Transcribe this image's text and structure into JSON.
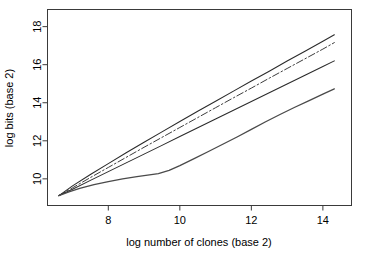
{
  "chart_data": {
    "type": "line",
    "title": "",
    "xlabel": "log number of clones (base 2)",
    "ylabel": "log bits (base 2)",
    "xlim": [
      6.3,
      14.8
    ],
    "ylim": [
      8.6,
      18.9
    ],
    "xticks": [
      8,
      10,
      12,
      14
    ],
    "xtick_labels": [
      "8",
      "10",
      "12",
      "14"
    ],
    "yticks": [
      10,
      12,
      14,
      16,
      18
    ],
    "ytick_labels": [
      "10",
      "12",
      "14",
      "16",
      "18"
    ],
    "grid": false,
    "legend": false,
    "legend_position": "none",
    "box": true,
    "series": [
      {
        "name": "upper-bound-line",
        "style": "solid",
        "color": "#2b2b2b",
        "width": 1.1,
        "x": [
          6.62,
          7.0,
          7.5,
          8.0,
          8.5,
          9.0,
          9.5,
          10.0,
          10.5,
          11.0,
          11.5,
          12.0,
          12.5,
          13.0,
          13.5,
          14.0,
          14.32
        ],
        "y": [
          9.12,
          9.63,
          10.23,
          10.8,
          11.37,
          11.92,
          12.47,
          13.01,
          13.55,
          14.08,
          14.61,
          15.14,
          15.66,
          16.19,
          16.71,
          17.23,
          17.57
        ]
      },
      {
        "name": "dash-dot-line",
        "style": "dashdot",
        "color": "#3d3d3d",
        "width": 1.0,
        "x": [
          6.62,
          7.0,
          7.5,
          8.0,
          8.5,
          9.0,
          9.5,
          10.0,
          10.5,
          11.0,
          11.5,
          12.0,
          12.5,
          13.0,
          13.5,
          14.0,
          14.32
        ],
        "y": [
          9.12,
          9.53,
          10.07,
          10.6,
          11.13,
          11.66,
          12.18,
          12.7,
          13.22,
          13.74,
          14.26,
          14.77,
          15.29,
          15.8,
          16.31,
          16.82,
          17.16
        ]
      },
      {
        "name": "lower-bound-line",
        "style": "solid",
        "color": "#2b2b2b",
        "width": 1.1,
        "x": [
          6.62,
          7.0,
          7.5,
          8.0,
          8.5,
          9.0,
          9.5,
          10.0,
          10.5,
          11.0,
          11.5,
          12.0,
          12.5,
          13.0,
          13.5,
          14.0,
          14.32
        ],
        "y": [
          9.12,
          9.46,
          9.92,
          10.38,
          10.84,
          11.3,
          11.76,
          12.22,
          12.68,
          13.14,
          13.6,
          14.06,
          14.52,
          14.98,
          15.44,
          15.9,
          16.2
        ]
      },
      {
        "name": "empirical-entropy-curve",
        "style": "solid",
        "color": "#4a4a4a",
        "width": 1.3,
        "x": [
          6.62,
          6.9,
          7.2,
          7.6,
          8.0,
          8.4,
          8.8,
          9.1,
          9.4,
          9.7,
          10.0,
          10.4,
          10.8,
          11.2,
          11.6,
          12.0,
          12.4,
          12.8,
          13.2,
          13.6,
          14.0,
          14.32
        ],
        "y": [
          9.12,
          9.32,
          9.5,
          9.7,
          9.86,
          10.0,
          10.12,
          10.2,
          10.28,
          10.45,
          10.7,
          11.06,
          11.44,
          11.82,
          12.2,
          12.6,
          13.0,
          13.38,
          13.75,
          14.1,
          14.45,
          14.73
        ]
      }
    ]
  },
  "axes": {
    "x_title": "log number of clones (base 2)",
    "y_title": "log bits (base 2)"
  }
}
